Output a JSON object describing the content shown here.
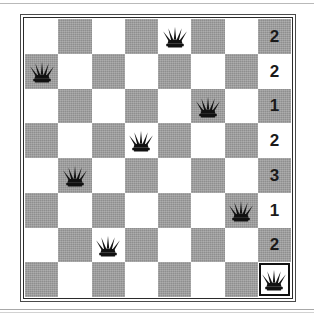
{
  "figure": {
    "kind": "chess-board-diagram",
    "board_size": 8,
    "icon_names": {
      "piece": "queen-icon"
    }
  },
  "colors": {
    "light_square": "#ffffff",
    "dark_square": "#8e8e8e",
    "piece": "#111111",
    "frame": "#2b2b2b",
    "highlight_border": "#111111",
    "number_text": "#1a1a1a"
  },
  "board": {
    "rows": [
      {
        "index": 1,
        "count_label": "2",
        "cells": [
          {
            "col": 1,
            "shade": "light",
            "piece": null,
            "selected": false
          },
          {
            "col": 2,
            "shade": "dark",
            "piece": null,
            "selected": false
          },
          {
            "col": 3,
            "shade": "light",
            "piece": null,
            "selected": false
          },
          {
            "col": 4,
            "shade": "dark",
            "piece": null,
            "selected": false
          },
          {
            "col": 5,
            "shade": "light",
            "piece": "queen",
            "selected": false
          },
          {
            "col": 6,
            "shade": "dark",
            "piece": null,
            "selected": false
          },
          {
            "col": 7,
            "shade": "light",
            "piece": null,
            "selected": false
          },
          {
            "col": 8,
            "shade": "dark",
            "piece": null,
            "selected": false,
            "count": "2"
          }
        ]
      },
      {
        "index": 2,
        "count_label": "2",
        "cells": [
          {
            "col": 1,
            "shade": "dark",
            "piece": "queen",
            "selected": false
          },
          {
            "col": 2,
            "shade": "light",
            "piece": null,
            "selected": false
          },
          {
            "col": 3,
            "shade": "dark",
            "piece": null,
            "selected": false
          },
          {
            "col": 4,
            "shade": "light",
            "piece": null,
            "selected": false
          },
          {
            "col": 5,
            "shade": "dark",
            "piece": null,
            "selected": false
          },
          {
            "col": 6,
            "shade": "light",
            "piece": null,
            "selected": false
          },
          {
            "col": 7,
            "shade": "dark",
            "piece": null,
            "selected": false
          },
          {
            "col": 8,
            "shade": "light",
            "piece": null,
            "selected": false,
            "count": "2"
          }
        ]
      },
      {
        "index": 3,
        "count_label": "1",
        "cells": [
          {
            "col": 1,
            "shade": "light",
            "piece": null,
            "selected": false
          },
          {
            "col": 2,
            "shade": "dark",
            "piece": null,
            "selected": false
          },
          {
            "col": 3,
            "shade": "light",
            "piece": null,
            "selected": false
          },
          {
            "col": 4,
            "shade": "dark",
            "piece": null,
            "selected": false
          },
          {
            "col": 5,
            "shade": "light",
            "piece": null,
            "selected": false
          },
          {
            "col": 6,
            "shade": "dark",
            "piece": "queen",
            "selected": false
          },
          {
            "col": 7,
            "shade": "light",
            "piece": null,
            "selected": false
          },
          {
            "col": 8,
            "shade": "dark",
            "piece": null,
            "selected": false,
            "count": "1"
          }
        ]
      },
      {
        "index": 4,
        "count_label": "2",
        "cells": [
          {
            "col": 1,
            "shade": "dark",
            "piece": null,
            "selected": false
          },
          {
            "col": 2,
            "shade": "light",
            "piece": null,
            "selected": false
          },
          {
            "col": 3,
            "shade": "dark",
            "piece": null,
            "selected": false
          },
          {
            "col": 4,
            "shade": "light",
            "piece": "queen",
            "selected": false
          },
          {
            "col": 5,
            "shade": "dark",
            "piece": null,
            "selected": false
          },
          {
            "col": 6,
            "shade": "light",
            "piece": null,
            "selected": false
          },
          {
            "col": 7,
            "shade": "dark",
            "piece": null,
            "selected": false
          },
          {
            "col": 8,
            "shade": "light",
            "piece": null,
            "selected": false,
            "count": "2"
          }
        ]
      },
      {
        "index": 5,
        "count_label": "3",
        "cells": [
          {
            "col": 1,
            "shade": "light",
            "piece": null,
            "selected": false
          },
          {
            "col": 2,
            "shade": "dark",
            "piece": "queen",
            "selected": false
          },
          {
            "col": 3,
            "shade": "light",
            "piece": null,
            "selected": false
          },
          {
            "col": 4,
            "shade": "dark",
            "piece": null,
            "selected": false
          },
          {
            "col": 5,
            "shade": "light",
            "piece": null,
            "selected": false
          },
          {
            "col": 6,
            "shade": "dark",
            "piece": null,
            "selected": false
          },
          {
            "col": 7,
            "shade": "light",
            "piece": null,
            "selected": false
          },
          {
            "col": 8,
            "shade": "dark",
            "piece": null,
            "selected": false,
            "count": "3"
          }
        ]
      },
      {
        "index": 6,
        "count_label": "1",
        "cells": [
          {
            "col": 1,
            "shade": "dark",
            "piece": null,
            "selected": false
          },
          {
            "col": 2,
            "shade": "light",
            "piece": null,
            "selected": false
          },
          {
            "col": 3,
            "shade": "dark",
            "piece": null,
            "selected": false
          },
          {
            "col": 4,
            "shade": "light",
            "piece": null,
            "selected": false
          },
          {
            "col": 5,
            "shade": "dark",
            "piece": null,
            "selected": false
          },
          {
            "col": 6,
            "shade": "light",
            "piece": null,
            "selected": false
          },
          {
            "col": 7,
            "shade": "dark",
            "piece": "queen",
            "selected": false
          },
          {
            "col": 8,
            "shade": "light",
            "piece": null,
            "selected": false,
            "count": "1"
          }
        ]
      },
      {
        "index": 7,
        "count_label": "2",
        "cells": [
          {
            "col": 1,
            "shade": "light",
            "piece": null,
            "selected": false
          },
          {
            "col": 2,
            "shade": "dark",
            "piece": null,
            "selected": false
          },
          {
            "col": 3,
            "shade": "light",
            "piece": "queen",
            "selected": false
          },
          {
            "col": 4,
            "shade": "dark",
            "piece": null,
            "selected": false
          },
          {
            "col": 5,
            "shade": "light",
            "piece": null,
            "selected": false
          },
          {
            "col": 6,
            "shade": "dark",
            "piece": null,
            "selected": false
          },
          {
            "col": 7,
            "shade": "light",
            "piece": null,
            "selected": false
          },
          {
            "col": 8,
            "shade": "dark",
            "piece": null,
            "selected": false,
            "count": "2"
          }
        ]
      },
      {
        "index": 8,
        "count_label": "",
        "cells": [
          {
            "col": 1,
            "shade": "dark",
            "piece": null,
            "selected": false
          },
          {
            "col": 2,
            "shade": "light",
            "piece": null,
            "selected": false
          },
          {
            "col": 3,
            "shade": "dark",
            "piece": null,
            "selected": false
          },
          {
            "col": 4,
            "shade": "light",
            "piece": null,
            "selected": false
          },
          {
            "col": 5,
            "shade": "dark",
            "piece": null,
            "selected": false
          },
          {
            "col": 6,
            "shade": "light",
            "piece": null,
            "selected": false
          },
          {
            "col": 7,
            "shade": "dark",
            "piece": null,
            "selected": false
          },
          {
            "col": 8,
            "shade": "light",
            "piece": "queen",
            "selected": true,
            "count": ""
          }
        ]
      }
    ]
  }
}
